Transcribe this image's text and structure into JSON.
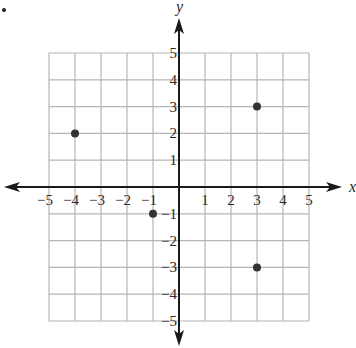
{
  "chart_data": {
    "type": "scatter",
    "title": "",
    "xlabel": "x",
    "ylabel": "y",
    "xlim": [
      -5,
      5
    ],
    "ylim": [
      -5,
      5
    ],
    "grid": true,
    "x_ticks": [
      -5,
      -4,
      -3,
      -2,
      -1,
      1,
      2,
      3,
      4,
      5
    ],
    "y_ticks": [
      -5,
      -4,
      -3,
      -2,
      -1,
      1,
      2,
      3,
      4,
      5
    ],
    "x_tick_labels": [
      "−5",
      "−4",
      "−3",
      "−2",
      "−1",
      "1",
      "2",
      "3",
      "4",
      "5"
    ],
    "y_tick_labels": [
      "−5",
      "−4",
      "−3",
      "−2",
      "−1",
      "1",
      "2",
      "3",
      "4",
      "5"
    ],
    "points": [
      {
        "x": -4,
        "y": 2
      },
      {
        "x": 3,
        "y": 3
      },
      {
        "x": -1,
        "y": -1
      },
      {
        "x": 3,
        "y": -3
      }
    ],
    "colors": {
      "grid": "#b5b5b5",
      "axis": "#1a1a1a",
      "point": "#333333",
      "text": "#2a2a2a"
    }
  }
}
